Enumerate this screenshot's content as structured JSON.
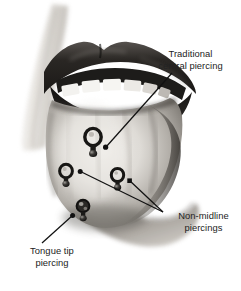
{
  "figure": {
    "background_color": "#ffffff",
    "width": 241,
    "height": 291
  },
  "labels": {
    "traditional": {
      "text": "Traditional\ncentral piercing",
      "line1": "Traditional",
      "line2": "central piercing",
      "color": "#232323"
    },
    "non_midline": {
      "text": "Non-midline\npiercings",
      "line1": "Non-midline",
      "line2": "piercings",
      "color": "#232323"
    },
    "tongue_tip": {
      "text": "Tongue tip\npiercing",
      "line1": "Tongue tip",
      "line2": "piercing",
      "color": "#232323"
    }
  },
  "illustration": {
    "subject": "open mouth with tongue protruding showing four barbell piercings",
    "style": "grayscale halftone medical illustration",
    "colors": {
      "lip_dark": "#242424",
      "lip_mid": "#4a4a4a",
      "tooth": "#f2f2f0",
      "tongue_light": "#e6e4e0",
      "tongue_mid": "#b4b0ab",
      "tongue_shadow": "#6e6a66",
      "skin_light": "#dedbd6",
      "stud_dark": "#1c1c1c",
      "leader_line": "#111111"
    },
    "piercings": [
      {
        "name": "traditional-central-piercing",
        "label_ref": "traditional",
        "x": 93,
        "y": 139,
        "position": "midline center of dorsum"
      },
      {
        "name": "non-midline-piercing-left",
        "label_ref": "non_midline",
        "x": 67,
        "y": 174,
        "position": "left of midline"
      },
      {
        "name": "non-midline-piercing-right",
        "label_ref": "non_midline",
        "x": 118,
        "y": 178,
        "position": "right of midline"
      },
      {
        "name": "tongue-tip-piercing",
        "label_ref": "tongue_tip",
        "x": 83,
        "y": 210,
        "position": "anterior tip of tongue"
      }
    ],
    "leader_lines": [
      {
        "name": "leader-traditional",
        "from_label": "traditional",
        "x1": 172,
        "y1": 73,
        "x2": 105,
        "y2": 147
      },
      {
        "name": "leader-non-midline-left",
        "from_label": "non_midline",
        "x1": 163,
        "y1": 212,
        "x2": 80,
        "y2": 172
      },
      {
        "name": "leader-non-midline-right",
        "from_label": "non_midline",
        "x1": 163,
        "y1": 212,
        "x2": 129,
        "y2": 181
      },
      {
        "name": "leader-tongue-tip",
        "from_label": "tongue_tip",
        "x1": 42,
        "y1": 243,
        "x2": 72,
        "y2": 216
      }
    ]
  }
}
